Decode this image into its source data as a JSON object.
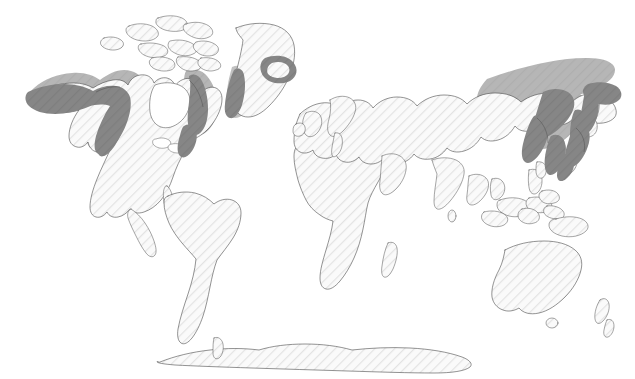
{
  "map": {
    "title": "World species distribution map",
    "projection": "equirectangular",
    "width": 635,
    "height": 379,
    "background_color": "#ffffff",
    "land_fill_color": "#fafafa",
    "land_hatch_color": "#e2e2e2",
    "land_outline_color": "#3a3a3a",
    "range_halo_color": "#b4b4b4",
    "range_band_color": "#858585",
    "has_title_text": false,
    "has_legend": false,
    "has_graticule": false,
    "has_labels": false
  },
  "legend_semantics": {
    "halo_meaning": "broad range / diffuse distribution zone",
    "band_meaning": "core coastal breeding or occurrence band"
  },
  "range_regions": [
    {
      "name": "alaska-aleutian-halo",
      "type": "halo"
    },
    {
      "name": "alaska-aleutian-coastal-band",
      "type": "band"
    },
    {
      "name": "southwest-greenland-band",
      "type": "band"
    },
    {
      "name": "iceland-ring-band",
      "type": "band"
    },
    {
      "name": "labrador-new-england-halo",
      "type": "halo"
    },
    {
      "name": "labrador-new-england-band",
      "type": "band"
    },
    {
      "name": "siberian-far-east-halo",
      "type": "halo"
    },
    {
      "name": "okhotsk-kamchatka-band",
      "type": "band"
    },
    {
      "name": "japan-korea-band",
      "type": "band"
    },
    {
      "name": "chukotka-bering-band",
      "type": "band"
    }
  ],
  "landmasses": [
    {
      "name": "north-america",
      "shaded": true
    },
    {
      "name": "greenland",
      "shaded": true
    },
    {
      "name": "iceland",
      "shaded": true
    },
    {
      "name": "eurasia",
      "shaded": true
    },
    {
      "name": "japan",
      "shaded": true
    },
    {
      "name": "south-america",
      "shaded": false
    },
    {
      "name": "africa",
      "shaded": false
    },
    {
      "name": "australia",
      "shaded": false
    },
    {
      "name": "new-zealand",
      "shaded": false
    },
    {
      "name": "indonesia-philippines",
      "shaded": false
    },
    {
      "name": "antarctica",
      "shaded": false
    },
    {
      "name": "british-isles",
      "shaded": false
    },
    {
      "name": "madagascar",
      "shaded": false
    }
  ]
}
